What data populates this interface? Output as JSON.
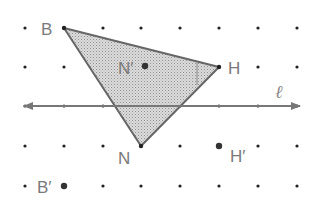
{
  "diagram": {
    "grid": {
      "xs": [
        25,
        64,
        103,
        141,
        180,
        219,
        258,
        297
      ],
      "ys": [
        28,
        67,
        106,
        146,
        186
      ],
      "dot_color": "#222222"
    },
    "triangle": {
      "vertices": {
        "B": [
          64,
          28
        ],
        "H": [
          219,
          67
        ],
        "N": [
          141,
          146
        ]
      },
      "fill": "#d0d0d0",
      "stroke": "#666666"
    },
    "line": {
      "label": "ℓ",
      "y": 106,
      "x1": 22,
      "x2": 302,
      "color": "#777777"
    },
    "labels": {
      "B": "B",
      "H": "H",
      "N": "N",
      "N_prime": "N′",
      "H_prime": "H′",
      "B_prime": "B′"
    },
    "image_points": {
      "N_prime": [
        145,
        66
      ],
      "H_prime": [
        219,
        146
      ],
      "B_prime": [
        64,
        186
      ]
    }
  }
}
